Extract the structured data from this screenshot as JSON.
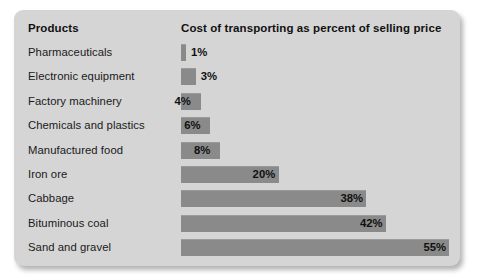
{
  "panel": {
    "background_color": "#d5d5d5",
    "bar_color": "#8a8a8a"
  },
  "header": {
    "category_label": "Products",
    "value_label": "Cost of transporting as percent of selling price"
  },
  "chart_data": {
    "type": "bar",
    "orientation": "horizontal",
    "title": "",
    "xlabel": "Cost of transporting as percent of selling price",
    "ylabel": "Products",
    "grid": false,
    "legend": false,
    "xlim": [
      0,
      58
    ],
    "categories": [
      "Pharmaceuticals",
      "Electronic equipment",
      "Factory machinery",
      "Chemicals and plastics",
      "Manufactured food",
      "Iron ore",
      "Cabbage",
      "Bituminous coal",
      "Sand and gravel"
    ],
    "values": [
      1,
      3,
      4,
      6,
      8,
      20,
      38,
      42,
      55
    ],
    "value_labels": [
      "1%",
      "3%",
      "4%",
      "6%",
      "8%",
      "20%",
      "38%",
      "42%",
      "55%"
    ],
    "label_placement": [
      "outside",
      "outside",
      "inside",
      "inside",
      "inside",
      "inside",
      "inside",
      "inside",
      "inside"
    ]
  }
}
